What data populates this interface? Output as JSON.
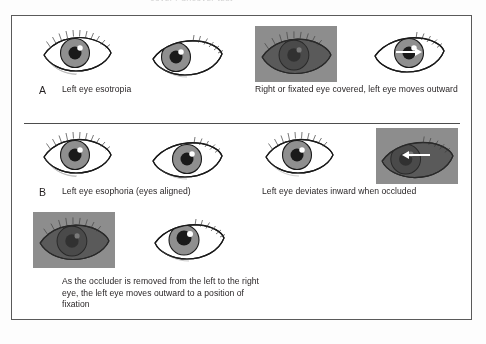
{
  "figure": {
    "title_fragment": "cover / uncover test",
    "panels": [
      {
        "letter": "A",
        "left_caption": "Left eye esotropia",
        "right_caption": "Right or fixated eye covered, left eye moves outward",
        "eyes": [
          {
            "name": "right-eye-straight",
            "gaze": "center",
            "occluded": false,
            "arrow": "none"
          },
          {
            "name": "left-eye-esotropic",
            "gaze": "in",
            "occluded": false,
            "arrow": "none"
          },
          {
            "name": "right-eye-occluded",
            "gaze": "center",
            "occluded": true,
            "arrow": "none"
          },
          {
            "name": "left-eye-moves-outward",
            "gaze": "center",
            "occluded": false,
            "arrow": "right"
          }
        ]
      },
      {
        "letter": "B",
        "left_caption": "Left eye esophoria (eyes aligned)",
        "right_caption": "Left eye deviates inward when occluded",
        "eyes": [
          {
            "name": "right-eye-aligned",
            "gaze": "center",
            "occluded": false,
            "arrow": "none"
          },
          {
            "name": "left-eye-aligned",
            "gaze": "center",
            "occluded": false,
            "arrow": "none"
          },
          {
            "name": "right-eye-fixating",
            "gaze": "center",
            "occluded": false,
            "arrow": "none"
          },
          {
            "name": "left-eye-deviates-inward",
            "gaze": "in",
            "occluded": true,
            "arrow": "left"
          }
        ]
      },
      {
        "letter": "",
        "left_caption": "As the occluder is removed from the left to the right eye, the left eye moves outward to a position of fixation",
        "right_caption": "",
        "eyes": [
          {
            "name": "left-eye-occluded",
            "gaze": "center",
            "occluded": true,
            "arrow": "none"
          },
          {
            "name": "right-eye-uncovered-fixating",
            "gaze": "in",
            "occluded": false,
            "arrow": "none"
          }
        ]
      }
    ],
    "colors": {
      "occluder_gray": "#8d8d8d",
      "iris_gray": "#8f8f8f",
      "pupil_black": "#1a1a1a",
      "outline": "#1a1a1a",
      "frame_border": "#5a5a5a",
      "divider": "#4d4d4d",
      "text": "#231f20",
      "arrow_white": "#ffffff",
      "page_background": "#ffffff"
    }
  }
}
